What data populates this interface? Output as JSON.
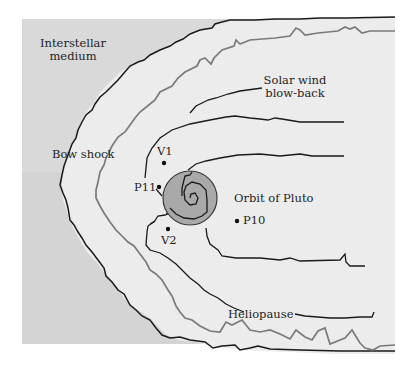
{
  "diagram": {
    "colors": {
      "background": "#ffffff",
      "interstellar": "#d8d8d8",
      "heliosheath": "#ececec",
      "bow_shock_line": "#1a1a1a",
      "heliopause_outer_line": "#7a7a7a",
      "inner_lines": "#1a1a1a",
      "pluto_orbit_fill": "#a8a8a8",
      "pluto_orbit_stroke": "#3a3a3a"
    },
    "labels": {
      "interstellar": [
        "Interstellar",
        "medium"
      ],
      "bow_shock": "Bow shock",
      "solar_wind": [
        "Solar wind",
        "blow-back"
      ],
      "orbit_pluto": "Orbit of Pluto",
      "heliopause": "Heliopause"
    },
    "spacecraft": [
      {
        "id": "V1",
        "label": "V1",
        "x": 164,
        "y": 163
      },
      {
        "id": "P11",
        "label": "P11",
        "x": 159,
        "y": 186
      },
      {
        "id": "V2",
        "label": "V2",
        "x": 168,
        "y": 229
      },
      {
        "id": "P10",
        "label": "P10",
        "x": 237,
        "y": 220
      }
    ]
  }
}
